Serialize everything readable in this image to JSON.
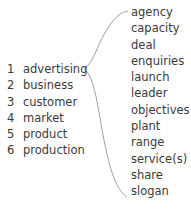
{
  "exercise": {
    "left_items": [
      {
        "num": "1",
        "word": "advertising"
      },
      {
        "num": "2",
        "word": "business"
      },
      {
        "num": "3",
        "word": "customer"
      },
      {
        "num": "4",
        "word": "market"
      },
      {
        "num": "5",
        "word": "product"
      },
      {
        "num": "6",
        "word": "production"
      }
    ],
    "right_items": [
      "agency",
      "capacity",
      "deal",
      "enquiries",
      "launch",
      "leader",
      "objectives",
      "plant",
      "range",
      "service(s)",
      "share",
      "slogan"
    ],
    "line_color": "#9a9a9a"
  }
}
